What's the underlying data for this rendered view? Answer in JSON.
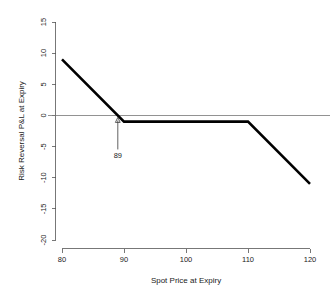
{
  "chart_data": {
    "type": "line",
    "title": "",
    "xlabel": "Spot Price at Expiry",
    "ylabel": "Risk Reversal P&L at Expiry",
    "xlim": [
      80,
      120
    ],
    "ylim": [
      -20,
      15
    ],
    "xticks": [
      80,
      90,
      100,
      110,
      120
    ],
    "yticks": [
      15,
      10,
      5,
      0,
      -5,
      -10,
      -15,
      -20
    ],
    "xtick_labels": [
      "80",
      "90",
      "100",
      "110",
      "120"
    ],
    "ytick_labels": [
      "15",
      "10",
      "5",
      "0",
      "-5",
      "-10",
      "-15",
      "-20"
    ],
    "grid": false,
    "legend": false,
    "zero_line": 0,
    "series": [
      {
        "name": "Risk Reversal P&L at Expiry",
        "color": "#000000",
        "x": [
          80,
          90,
          110,
          120
        ],
        "values": [
          9,
          -1,
          -1,
          -11
        ]
      }
    ],
    "annotations": [
      {
        "label": "89",
        "x": 89,
        "y": 0,
        "type": "arrow-up",
        "description": "break-even spot price"
      }
    ]
  },
  "axis": {
    "y_title": "Risk Reversal P&L at Expiry",
    "x_title": "Spot Price at Expiry",
    "y_labels": {
      "t0": "15",
      "t1": "10",
      "t2": "5",
      "t3": "0",
      "t4": "-5",
      "t5": "-10",
      "t6": "-15",
      "t7": "-20"
    },
    "x_labels": {
      "t0": "80",
      "t1": "90",
      "t2": "100",
      "t3": "110",
      "t4": "120"
    }
  },
  "annotation": {
    "breakeven_label": "89"
  },
  "colors": {
    "line": "#000000",
    "axis": "#555555",
    "zero": "#777777",
    "background": "#ffffff",
    "text": "#1a1a1a"
  }
}
